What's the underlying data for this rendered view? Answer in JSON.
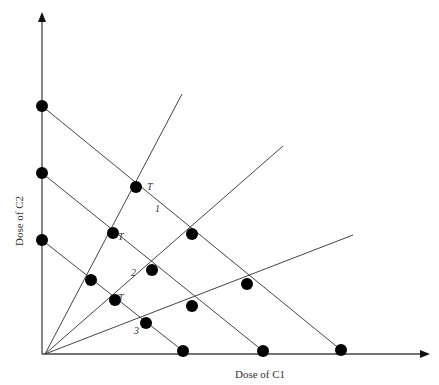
{
  "diagram": {
    "type": "isobologram-design",
    "x_axis": {
      "label": "Dose of C1"
    },
    "y_axis": {
      "label": "Dose of C2"
    },
    "colors": {
      "line": "#444444",
      "dot": "#000000",
      "text": "#333333"
    },
    "origin": [
      45,
      354
    ],
    "y_axis_tip": [
      42,
      12
    ],
    "x_axis_tip": [
      430,
      354
    ],
    "isoboles": [
      {
        "id": "1",
        "from": [
          42,
          106
        ],
        "to": [
          341,
          350
        ],
        "label": "1",
        "label_pos": [
          155,
          212
        ]
      },
      {
        "id": "2",
        "from": [
          42,
          173
        ],
        "to": [
          263,
          351
        ],
        "label": "2",
        "label_pos": [
          131,
          276
        ]
      },
      {
        "id": "3",
        "from": [
          42,
          240
        ],
        "to": [
          183,
          351
        ],
        "label": "3",
        "label_pos": [
          134,
          334
        ]
      }
    ],
    "rays": [
      {
        "id": "ray-steep",
        "to": [
          182,
          94
        ]
      },
      {
        "id": "ray-mid",
        "to": [
          283,
          146
        ]
      },
      {
        "id": "ray-flat",
        "to": [
          353,
          235
        ]
      }
    ],
    "dots": [
      [
        42,
        106
      ],
      [
        42,
        173
      ],
      [
        42,
        240
      ],
      [
        183,
        351
      ],
      [
        263,
        351
      ],
      [
        341,
        350
      ],
      [
        136,
        187
      ],
      [
        113,
        233
      ],
      [
        91,
        280
      ],
      [
        192,
        234
      ],
      [
        152,
        270
      ],
      [
        115,
        300
      ],
      [
        247,
        284
      ],
      [
        192,
        306
      ],
      [
        146,
        323
      ]
    ],
    "t_labels": [
      {
        "text": "T",
        "pos": [
          147,
          190
        ]
      },
      {
        "text": "T",
        "pos": [
          118,
          240
        ]
      },
      {
        "text": "T",
        "pos": [
          118,
          301
        ]
      }
    ]
  }
}
